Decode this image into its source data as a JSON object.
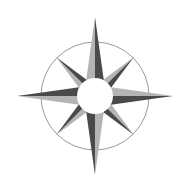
{
  "image": {
    "subject": "compass-rose",
    "width": 185,
    "height": 189,
    "background": "#ffffff"
  },
  "compass": {
    "center": [
      95,
      96
    ],
    "outer_ring": {
      "radius": 54,
      "stroke": "#9a9a9a",
      "stroke_width": 1
    },
    "inner_circle": {
      "radius": 18,
      "fill": "#ffffff"
    },
    "colors": {
      "light": "#b4b4b4",
      "dark": "#4a4a4a"
    },
    "points": [
      {
        "name": "N",
        "angle": 0,
        "length": 79,
        "half_width": 11
      },
      {
        "name": "NE",
        "angle": 45,
        "length": 55,
        "half_width": 8
      },
      {
        "name": "E",
        "angle": 90,
        "length": 78,
        "half_width": 11
      },
      {
        "name": "SE",
        "angle": 135,
        "length": 55,
        "half_width": 8
      },
      {
        "name": "S",
        "angle": 180,
        "length": 79,
        "half_width": 11
      },
      {
        "name": "SW",
        "angle": 225,
        "length": 55,
        "half_width": 8
      },
      {
        "name": "W",
        "angle": 270,
        "length": 78,
        "half_width": 11
      },
      {
        "name": "NW",
        "angle": 315,
        "length": 55,
        "half_width": 8
      }
    ]
  }
}
